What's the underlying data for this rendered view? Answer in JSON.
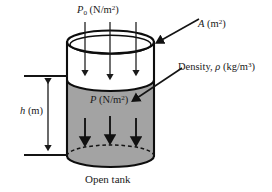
{
  "figure": {
    "caption": "Open tank"
  },
  "labels": {
    "ambient_pressure": {
      "symbol": "P",
      "subscript": "0",
      "units_prefix": "(N/m",
      "units_exponent": "2",
      "units_suffix": ")"
    },
    "area": {
      "symbol": "A",
      "units_prefix": "(m",
      "units_exponent": "2",
      "units_suffix": ")"
    },
    "density": {
      "text": "Density,",
      "symbol": "ρ",
      "units_prefix": "(kg/m",
      "units_exponent": "3",
      "units_suffix": ")"
    },
    "pressure": {
      "symbol": "P",
      "units_prefix": "(N/m",
      "units_exponent": "2",
      "units_suffix": ")"
    },
    "depth": {
      "symbol": "h",
      "units": "(m)"
    }
  },
  "colors": {
    "fluid_fill": "#a3a3a3",
    "outline": "#0d0d0d",
    "arrow": "#1a1a1a",
    "background": "#ffffff"
  },
  "geometry": {
    "cylinder_left_x": 67,
    "cylinder_right_x": 154,
    "top_rim_center_y": 42,
    "fluid_surface_y": 80,
    "bottom_center_y": 156,
    "ellipse_rx": 43.5,
    "ellipse_ry": 11,
    "top_arrow_x": [
      85,
      110,
      136
    ],
    "top_arrow_start_y": 22,
    "fluid_arrow_x": [
      85,
      110,
      136
    ],
    "fluid_arrow_start_y": 118,
    "fluid_arrow_end_y": 147,
    "depth_line_upper_y": 76,
    "depth_line_lower_y": 155,
    "depth_arrow_x": 48
  }
}
